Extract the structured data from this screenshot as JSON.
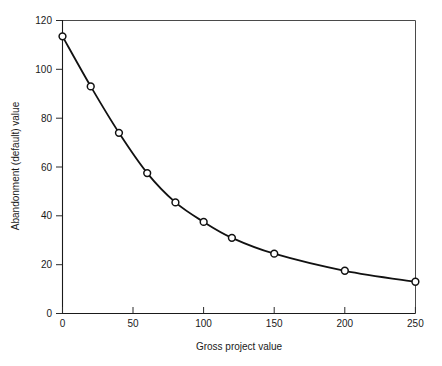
{
  "chart_data": {
    "type": "line",
    "title": "",
    "xlabel": "Gross project value",
    "ylabel": "Abandonment (default) value",
    "xlim": [
      0,
      250
    ],
    "ylim": [
      0,
      120
    ],
    "grid": false,
    "legend": null,
    "marker": "open-circle",
    "line_color": "#111111",
    "marker_face_color": "#ffffff",
    "x": [
      0,
      20,
      40,
      60,
      80,
      100,
      120,
      150,
      200,
      250
    ],
    "values": [
      113.5,
      93,
      74,
      57.5,
      45.5,
      37.5,
      31,
      24.5,
      17.5,
      13
    ],
    "series": [
      {
        "name": "Abandonment (default) value",
        "x": [
          0,
          20,
          40,
          60,
          80,
          100,
          120,
          150,
          200,
          250
        ],
        "values": [
          113.5,
          93,
          74,
          57.5,
          45.5,
          37.5,
          31,
          24.5,
          17.5,
          13
        ]
      }
    ],
    "xticks": [
      0,
      50,
      100,
      150,
      200,
      250
    ],
    "xtick_labels": [
      "0",
      "50",
      "100",
      "150",
      "200",
      "250"
    ],
    "yticks": [
      0,
      20,
      40,
      60,
      80,
      100,
      120
    ],
    "ytick_labels": [
      "0",
      "20",
      "40",
      "60",
      "80",
      "100",
      "120"
    ]
  }
}
